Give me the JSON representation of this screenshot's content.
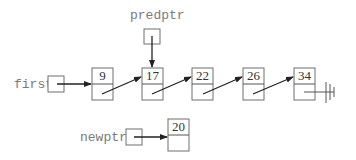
{
  "diagram": {
    "type": "linked-list-insertion",
    "pointers": [
      {
        "id": "first",
        "label": "first",
        "points_to": "9"
      },
      {
        "id": "predptr",
        "label": "predptr",
        "points_to": "17"
      },
      {
        "id": "newptr",
        "label": "newptr",
        "points_to": "20"
      }
    ],
    "list_nodes": [
      {
        "value": "9",
        "next": "17"
      },
      {
        "value": "17",
        "next": "22"
      },
      {
        "value": "22",
        "next": "26"
      },
      {
        "value": "26",
        "next": "34"
      },
      {
        "value": "34",
        "next": "null"
      }
    ],
    "new_node": {
      "value": "20",
      "next": ""
    },
    "null_symbol": "ground-icon",
    "colors": {
      "label": "#7a7a7a",
      "border": "#6e6e6e",
      "arrow": "#222222"
    }
  }
}
